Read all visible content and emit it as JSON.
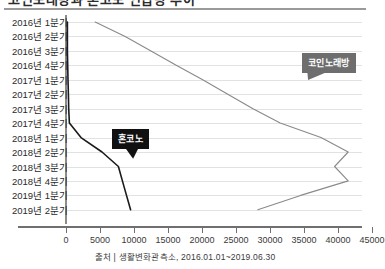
{
  "title": {
    "text": "코인노래방과 혼코노 언급량 추이",
    "clipped": true
  },
  "source": {
    "text": "출처 | 생활변화관측소, 2016.01.01~2019.06.30"
  },
  "callouts": {
    "series_gray": "코인노래방",
    "series_black": "혼코노"
  },
  "axis": {
    "x_ticks": [
      "0",
      "5000",
      "10000",
      "15000",
      "20000",
      "25000",
      "30000",
      "35000",
      "40000",
      "45000"
    ],
    "y_labels": [
      "2016년 1분기",
      "2016년 2분기",
      "2016년 3분기",
      "2016년 4분기",
      "2017년 1분기",
      "2017년 2분기",
      "2017년 3분기",
      "2017년 4분기",
      "2018년 1분기",
      "2018년 2분기",
      "2018년 3분기",
      "2018년 4분기",
      "2019년 1분기",
      "2019년 2분기"
    ]
  },
  "colors": {
    "series_gray": "#8a8a8a",
    "series_black": "#1a1a1a",
    "gridline": "#e2e2e2",
    "axis": "#6f6f6f",
    "callout_dark_bg": "#111111",
    "callout_gray_bg": "#6e6e6e"
  },
  "chart_data": {
    "type": "line",
    "orientation": "horizontal",
    "title": "코인노래방과 혼코노 언급량 추이",
    "xlabel": "",
    "ylabel": "",
    "xlim": [
      0,
      45000
    ],
    "grid": true,
    "legend": "callout-labels",
    "categories": [
      "2016년 1분기",
      "2016년 2분기",
      "2016년 3분기",
      "2016년 4분기",
      "2017년 1분기",
      "2017년 2분기",
      "2017년 3분기",
      "2017년 4분기",
      "2018년 1분기",
      "2018년 2분기",
      "2018년 3분기",
      "2018년 4분기",
      "2019년 1분기",
      "2019년 2분기"
    ],
    "series": [
      {
        "name": "코인노래방",
        "color": "#8a8a8a",
        "values": [
          4300,
          8700,
          12500,
          16200,
          20100,
          23800,
          27500,
          31500,
          37500,
          41500,
          39500,
          41500,
          34500,
          28200
        ]
      },
      {
        "name": "혼코노",
        "color": "#1a1a1a",
        "values": [
          200,
          200,
          200,
          250,
          300,
          350,
          400,
          500,
          2200,
          5300,
          7700,
          8300,
          8900,
          9500
        ]
      }
    ]
  }
}
